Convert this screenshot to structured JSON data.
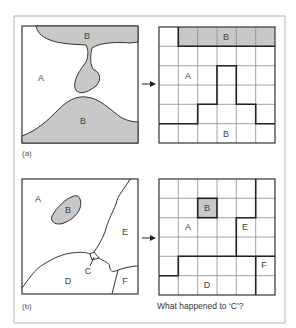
{
  "figure": {
    "frame_color": "#b0b0b0",
    "shade_color": "#c8c8c8",
    "line_color": "#333333",
    "grid_color": "#888888"
  },
  "panel_a": {
    "caption": "(a)",
    "vector_labels": [
      {
        "text": "B",
        "x": 87,
        "y": 39
      },
      {
        "text": "A",
        "x": 41,
        "y": 81
      },
      {
        "text": "B",
        "x": 83,
        "y": 124
      }
    ],
    "raster_labels": [
      {
        "text": "B",
        "x": 226,
        "y": 39
      },
      {
        "text": "A",
        "x": 189,
        "y": 78
      },
      {
        "text": "B",
        "x": 226,
        "y": 134
      }
    ],
    "grid": {
      "rows": 6,
      "cols": 6,
      "shaded_cells": [
        [
          0,
          1
        ],
        [
          0,
          2
        ],
        [
          0,
          3
        ],
        [
          0,
          4
        ],
        [
          0,
          5
        ]
      ]
    }
  },
  "panel_b": {
    "caption": "(b)",
    "vector_labels": [
      {
        "text": "A",
        "x": 38,
        "y": 201
      },
      {
        "text": "B",
        "x": 68,
        "y": 212
      },
      {
        "text": "E",
        "x": 125,
        "y": 234
      },
      {
        "text": "C",
        "x": 88,
        "y": 272
      },
      {
        "text": "D",
        "x": 68,
        "y": 283
      },
      {
        "text": "F",
        "x": 125,
        "y": 283
      }
    ],
    "raster_labels": [
      {
        "text": "B",
        "x": 207,
        "y": 210
      },
      {
        "text": "A",
        "x": 188,
        "y": 229
      },
      {
        "text": "E",
        "x": 245,
        "y": 229
      },
      {
        "text": "F",
        "x": 264,
        "y": 267
      },
      {
        "text": "D",
        "x": 207,
        "y": 287
      }
    ],
    "grid": {
      "rows": 6,
      "cols": 6,
      "shaded_cells": [
        [
          1,
          2
        ]
      ]
    },
    "question": "What happened to ‘C’?"
  }
}
